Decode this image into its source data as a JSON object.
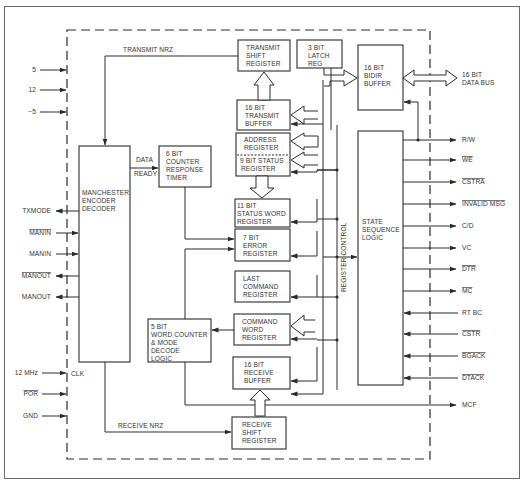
{
  "diagram": {
    "type": "block-diagram",
    "blocks": {
      "transmit_shift_register": [
        "TRANSMIT",
        "SHIFT",
        "REGISTER"
      ],
      "latch_reg": [
        "3 BIT",
        "LATCH",
        "REG"
      ],
      "bidir_buffer": [
        "16 BIT",
        "BIDIR",
        "BUFFER"
      ],
      "transmit_buffer": [
        "16 BIT",
        "TRANSMIT",
        "BUFFER"
      ],
      "address_register": [
        "ADDRESS",
        "REGISTER"
      ],
      "status_register_9bit": [
        "9 BIT STATUS",
        "REGISTER"
      ],
      "status_word_register": [
        "11 BIT",
        "STATUS WORD",
        "REGISTER"
      ],
      "error_register": [
        "7 BIT",
        "ERROR",
        "REGISTER"
      ],
      "last_command_register": [
        "LAST",
        "COMMAND",
        "REGISTER"
      ],
      "command_word_register": [
        "COMMAND",
        "WORD",
        "REGISTER"
      ],
      "receive_buffer": [
        "16 BIT",
        "RECEIVE",
        "BUFFER"
      ],
      "receive_shift_register": [
        "RECEIVE",
        "SHIFT",
        "REGISTER"
      ],
      "manchester": [
        "MANCHESTER",
        "ENCODER",
        "DECODER"
      ],
      "counter_timer": [
        "6 BIT",
        "COUNTER",
        "RESPONSE",
        "TIMER"
      ],
      "word_counter": [
        "5 BIT",
        "WORD COUNTER",
        "& MODE",
        "DECODE",
        "LOGIC"
      ],
      "state_sequence_logic": [
        "STATE",
        "SEQUENCE",
        "LOGIC"
      ]
    },
    "internal_labels": {
      "transmit_nrz": "TRANSMIT NRZ",
      "receive_nrz": "RECEIVE NRZ",
      "data": "DATA",
      "ready": "READY",
      "register_control": "REGISTER CONTROL",
      "clk": "CLK",
      "data_bus": [
        "16 BIT",
        "DATA BUS"
      ]
    },
    "left_pins": [
      {
        "label": "5",
        "dir": "in",
        "overbar": false
      },
      {
        "label": "12",
        "dir": "in",
        "overbar": false
      },
      {
        "label": "−5",
        "dir": "in",
        "overbar": false
      },
      {
        "label": "TXMODE",
        "dir": "out",
        "overbar": false
      },
      {
        "label": "MANIN",
        "dir": "in",
        "overbar": true
      },
      {
        "label": "MANIN",
        "dir": "in",
        "overbar": false
      },
      {
        "label": "MANOUT",
        "dir": "out",
        "overbar": true
      },
      {
        "label": "MANOUT",
        "dir": "out",
        "overbar": false
      },
      {
        "label": "12 MHz",
        "dir": "in",
        "overbar": false
      },
      {
        "label": "POR",
        "dir": "in",
        "overbar": true
      },
      {
        "label": "GND",
        "dir": "in",
        "overbar": false
      }
    ],
    "right_pins": [
      {
        "label": "R/W",
        "dir": "out",
        "overbar": false
      },
      {
        "label": "WE",
        "dir": "out",
        "overbar": true
      },
      {
        "label": "CSTRA",
        "dir": "out",
        "overbar": true
      },
      {
        "label": "INVALID MSG",
        "dir": "out",
        "overbar": true
      },
      {
        "label": "C/D",
        "dir": "out",
        "overbar": false
      },
      {
        "label": "VC",
        "dir": "out",
        "overbar": false
      },
      {
        "label": "DTR",
        "dir": "out",
        "overbar": true
      },
      {
        "label": "MC",
        "dir": "out",
        "overbar": true
      },
      {
        "label": "RT BC",
        "dir": "in",
        "overbar": false
      },
      {
        "label": "CSTR",
        "dir": "in",
        "overbar": true
      },
      {
        "label": "BGACK",
        "dir": "in",
        "overbar": true
      },
      {
        "label": "DTACK",
        "dir": "in",
        "overbar": true
      },
      {
        "label": "MCF",
        "dir": "out",
        "overbar": false
      }
    ]
  }
}
